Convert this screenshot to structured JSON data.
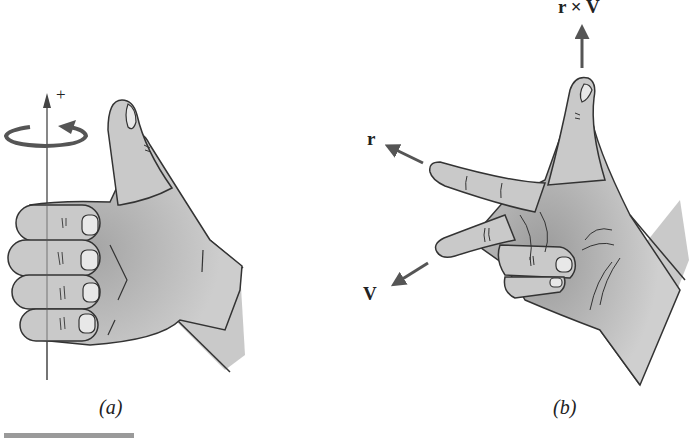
{
  "figure": {
    "panel_a": {
      "caption": "(a)",
      "axis_sign": "+",
      "description": "Right hand with fingers curled around a vertical axis, thumb pointing up; circular arrow shows rotation direction"
    },
    "panel_b": {
      "caption": "(b)",
      "labels": {
        "r": "r",
        "v": "V",
        "cross": "r × V"
      },
      "description": "Right hand with index finger along r, middle finger along V, thumb along r × V"
    },
    "colors": {
      "skin": "#c9c9c9",
      "skin_shadow": "#9e9e9e",
      "outline": "#333333",
      "arrow": "#555555",
      "nail": "#e8e8e8",
      "footer_bar": "#9a9a9a"
    }
  }
}
